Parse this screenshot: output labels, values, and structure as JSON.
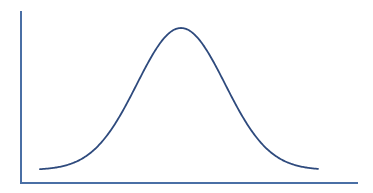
{
  "figure": {
    "title": "",
    "background_color": "#ffffff",
    "width": 373,
    "height": 193
  },
  "axes": {
    "color": "#4a6fa5",
    "stroke_width": 2,
    "y_axis": {
      "x": 21,
      "y_top": 11,
      "y_bottom": 184,
      "label": "",
      "ticks": []
    },
    "x_axis": {
      "y": 183,
      "x_left": 21,
      "x_right": 358,
      "label": "",
      "ticks": []
    }
  },
  "curve": {
    "color": "#2e4a7d",
    "stroke_width": 1.8,
    "label": ""
  },
  "chart_data": {
    "type": "line",
    "title": "",
    "subtitle": "",
    "xlabel": "",
    "ylabel": "",
    "legend": [],
    "grid": false,
    "annotations": [],
    "xlim": [
      0,
      373
    ],
    "ylim": [
      0,
      1
    ],
    "distribution": {
      "name": "normal",
      "mean_px": 181,
      "sigma_px": 44,
      "peak_y_px": 28,
      "baseline_y_px": 170,
      "x_start_px": 40,
      "x_end_px": 318
    },
    "x": [
      40,
      54,
      68,
      82,
      96,
      110,
      124,
      137,
      151,
      165,
      181,
      195,
      209,
      223,
      237,
      250,
      264,
      278,
      292,
      306,
      318
    ],
    "y": [
      0.009,
      0.018,
      0.035,
      0.064,
      0.111,
      0.181,
      0.278,
      0.388,
      0.535,
      0.688,
      0.831,
      0.939,
      0.989,
      0.975,
      0.902,
      0.791,
      0.647,
      0.494,
      0.352,
      0.234,
      0.147
    ],
    "values_normalized": [
      0.009,
      0.018,
      0.035,
      0.064,
      0.111,
      0.181,
      0.278,
      0.388,
      0.535,
      0.688,
      0.831,
      0.939,
      0.989,
      0.975,
      0.902,
      0.791,
      0.647,
      0.494,
      0.352,
      0.234,
      0.147
    ]
  }
}
